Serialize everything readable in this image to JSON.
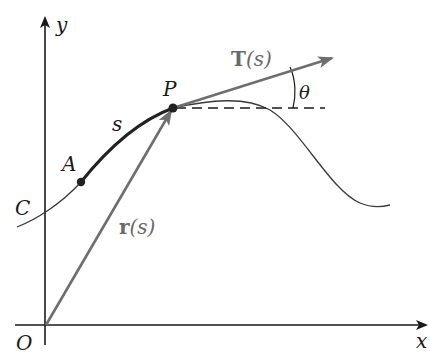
{
  "figure": {
    "type": "arc-length-parametrized-curve",
    "labels": {
      "y_axis": "y",
      "x_axis": "x",
      "origin": "O",
      "curve": "C",
      "start_point": "A",
      "point": "P",
      "arc_length": "s",
      "position_vector_bold": "r",
      "position_vector_arg": "(s)",
      "tangent_vector_bold": "T",
      "tangent_vector_arg": "(s)",
      "angle": "θ"
    },
    "colors": {
      "axes": "#1a1a1a",
      "curve": "#3a3a3a",
      "arc_segment": "#222222",
      "vectors": "#707070",
      "dashed_line": "#1a1a1a",
      "background": "#ffffff"
    },
    "geometry": {
      "origin": [
        45,
        325
      ],
      "point_A": [
        81,
        182
      ],
      "point_P": [
        173,
        108
      ],
      "tangent_tip": [
        332,
        58
      ],
      "dashed_end": [
        325,
        108
      ]
    }
  }
}
